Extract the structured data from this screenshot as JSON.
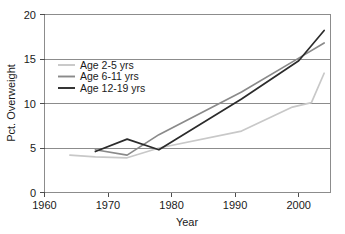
{
  "chart_data": {
    "type": "line",
    "title": "",
    "subtitle": "",
    "xlabel": "Year",
    "ylabel": "Pct. Overweight",
    "xlim": [
      1960,
      2005
    ],
    "ylim": [
      0,
      20
    ],
    "xticks": [
      "1960",
      "1970",
      "1980",
      "1990",
      "2000"
    ],
    "xtick_values": [
      1960,
      1970,
      1980,
      1990,
      2000
    ],
    "yticks": [
      "0",
      "5",
      "10",
      "15",
      "20"
    ],
    "ytick_values": [
      0,
      5,
      10,
      15,
      20
    ],
    "grid": "horizontal gridlines at 5, 10, 15, 20",
    "legend_position": "upper left inside plot",
    "series": [
      {
        "name": "Age 2-5 yrs",
        "color": "#c8c8c8",
        "x": [
          1964,
          1968,
          1973,
          1978,
          1991,
          1999,
          2002,
          2004
        ],
        "values": [
          4.2,
          4.0,
          3.9,
          5.0,
          6.9,
          9.6,
          10.1,
          13.4
        ]
      },
      {
        "name": "Age 6-11 yrs",
        "color": "#8a8a8a",
        "x": [
          1968,
          1973,
          1978,
          1991,
          2000,
          2004
        ],
        "values": [
          4.8,
          4.2,
          6.5,
          11.3,
          15.1,
          16.8
        ]
      },
      {
        "name": "Age 12-19 yrs",
        "color": "#2b2b2b",
        "x": [
          1968,
          1973,
          1978,
          1991,
          2000,
          2004
        ],
        "values": [
          4.6,
          6.0,
          4.8,
          10.5,
          14.8,
          18.2
        ]
      }
    ]
  },
  "legend": {
    "items": [
      {
        "label": "Age 2-5 yrs",
        "color": "#c8c8c8"
      },
      {
        "label": "Age 6-11 yrs",
        "color": "#8a8a8a"
      },
      {
        "label": "Age 12-19 yrs",
        "color": "#2b2b2b"
      }
    ]
  },
  "axes": {
    "y_title": "Pct. Overweight",
    "x_title": "Year",
    "y_labels": [
      "20",
      "15",
      "10",
      "5",
      "0"
    ],
    "x_labels": [
      "1960",
      "1970",
      "1980",
      "1990",
      "2000"
    ]
  },
  "colors": {
    "frame": "#8c8c8c",
    "grid": "#8c8c8c",
    "text": "#1a1a1a",
    "background": "#ffffff"
  }
}
